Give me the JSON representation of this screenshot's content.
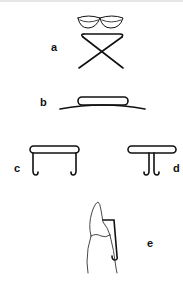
{
  "diagram": {
    "panels": [
      {
        "id": "a",
        "label": "a",
        "description": "two oval loops above a crossed X wire"
      },
      {
        "id": "b",
        "label": "b",
        "description": "flat rounded loop resting on a curved base wire"
      },
      {
        "id": "c",
        "label": "c",
        "description": "rounded bar with two hooked legs at the ends"
      },
      {
        "id": "d",
        "label": "d",
        "description": "rounded bar with two adjacent hooked legs in the center"
      },
      {
        "id": "e",
        "label": "e",
        "description": "tooth outline with a hooked wire clasp along its side"
      }
    ],
    "colors": {
      "line": "#111111",
      "outline": "#333333",
      "background": "#ffffff"
    }
  }
}
